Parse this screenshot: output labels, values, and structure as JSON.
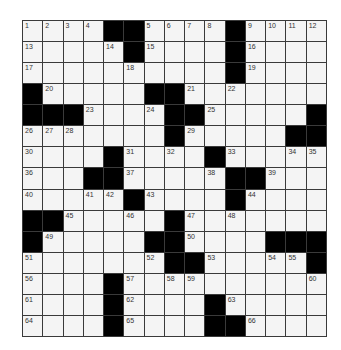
{
  "puzzle": {
    "size": {
      "rows": 15,
      "cols": 15
    },
    "colors": {
      "block": "#000000",
      "cell": "#f4f4f4",
      "grid_line": "#3a3a3a"
    },
    "rows": [
      [
        "1",
        "2",
        "3",
        "4",
        "#",
        "#",
        "5",
        "6",
        "7",
        "8",
        "#",
        "9",
        "10",
        "11",
        "12"
      ],
      [
        "13",
        ".",
        ".",
        ".",
        "14",
        "#",
        "15",
        ".",
        ".",
        ".",
        "#",
        "16",
        ".",
        ".",
        "."
      ],
      [
        "17",
        ".",
        ".",
        ".",
        ".",
        "18",
        ".",
        ".",
        ".",
        ".",
        "#",
        "19",
        ".",
        ".",
        "."
      ],
      [
        "#",
        "20",
        ".",
        ".",
        ".",
        ".",
        "#",
        "#",
        "21",
        ".",
        "22",
        ".",
        ".",
        ".",
        "."
      ],
      [
        "#",
        "#",
        "#",
        "23",
        ".",
        ".",
        "24",
        "#",
        "#",
        "25",
        ".",
        ".",
        ".",
        ".",
        "#"
      ],
      [
        "26",
        "27",
        "28",
        ".",
        ".",
        ".",
        ".",
        "#",
        "29",
        ".",
        ".",
        ".",
        ".",
        "#",
        "#"
      ],
      [
        "30",
        ".",
        ".",
        ".",
        "#",
        "31",
        ".",
        "32",
        ".",
        "#",
        "33",
        ".",
        ".",
        "34",
        "35"
      ],
      [
        "36",
        ".",
        ".",
        "#",
        "#",
        "37",
        ".",
        ".",
        ".",
        "38",
        "#",
        "#",
        "39",
        ".",
        "."
      ],
      [
        "40",
        ".",
        ".",
        "41",
        "42",
        "#",
        "43",
        ".",
        ".",
        ".",
        "#",
        "44",
        ".",
        ".",
        "."
      ],
      [
        "#",
        "#",
        "45",
        ".",
        ".",
        "46",
        ".",
        "#",
        "47",
        ".",
        "48",
        ".",
        ".",
        ".",
        "."
      ],
      [
        "#",
        "49",
        ".",
        ".",
        ".",
        ".",
        "#",
        "#",
        "50",
        ".",
        ".",
        ".",
        "#",
        "#",
        "#"
      ],
      [
        "51",
        ".",
        ".",
        ".",
        ".",
        ".",
        "52",
        "#",
        "#",
        "53",
        ".",
        ".",
        "54",
        "55",
        "#"
      ],
      [
        "56",
        ".",
        ".",
        ".",
        "#",
        "57",
        ".",
        "58",
        "59",
        ".",
        ".",
        ".",
        ".",
        ".",
        "60"
      ],
      [
        "61",
        ".",
        ".",
        ".",
        "#",
        "62",
        ".",
        ".",
        ".",
        "#",
        "63",
        ".",
        ".",
        ".",
        "."
      ],
      [
        "64",
        ".",
        ".",
        ".",
        "#",
        "65",
        ".",
        ".",
        ".",
        "#",
        "#",
        "66",
        ".",
        ".",
        "."
      ]
    ]
  }
}
